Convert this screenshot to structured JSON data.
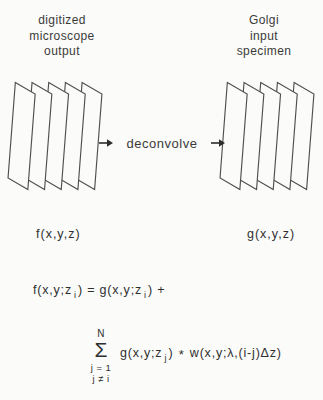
{
  "figure": {
    "left_label": {
      "line1": "digitized",
      "line2": "microscope",
      "line3": "output"
    },
    "right_label": {
      "line1": "Golgi",
      "line2": "input",
      "line3": "specimen"
    },
    "process": {
      "label": "deconvolve"
    },
    "left_stack_caption": "f(x,y,z)",
    "right_stack_caption": "g(x,y,z)",
    "equation1": {
      "p1": "f(x,y;z",
      "sub1": "i",
      "p2": ") = g(x,y;z",
      "sub2": "i",
      "p3": ") +"
    },
    "equation2": {
      "sum_upper": "N",
      "sigma": "Σ",
      "sum_lower1": "j = 1",
      "sum_lower2": "j ≠ i",
      "p1": "g(x,y;z",
      "sub1": "j",
      "p2": ")",
      "star": "*",
      "p3": "w(x,y;λ,(i-j)Δz)"
    },
    "stack": {
      "plane_count": 5
    },
    "colors": {
      "line": "#4f4f4f",
      "text": "#2f2f2f",
      "background": "#fbfbf9"
    }
  }
}
